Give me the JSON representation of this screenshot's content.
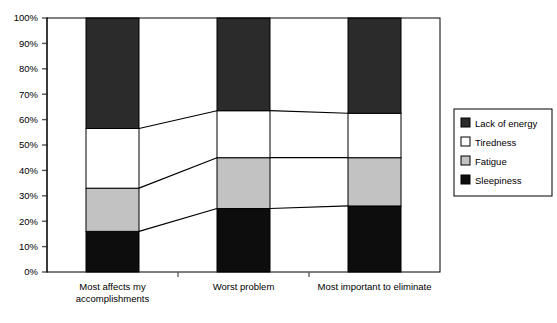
{
  "chart_data": {
    "type": "bar",
    "subtype": "stacked-100-percent",
    "title": "",
    "xlabel": "",
    "ylabel": "",
    "ylim": [
      0,
      100
    ],
    "ytick_labels": [
      "0%",
      "10%",
      "20%",
      "30%",
      "40%",
      "50%",
      "60%",
      "70%",
      "80%",
      "90%",
      "100%"
    ],
    "ytick_values": [
      0,
      10,
      20,
      30,
      40,
      50,
      60,
      70,
      80,
      90,
      100
    ],
    "grid": false,
    "legend_position": "right",
    "categories": [
      "Most affects my accomplishments",
      "Worst problem",
      "Most important to eliminate"
    ],
    "category_lines": [
      [
        "Most affects my",
        "accomplishments"
      ],
      [
        "Worst problem"
      ],
      [
        "Most important to eliminate"
      ]
    ],
    "series": [
      {
        "name": "Sleepiness",
        "color": "#0d0d0d",
        "values": [
          16,
          25,
          26
        ]
      },
      {
        "name": "Fatigue",
        "color": "#c2c2c2",
        "values": [
          17,
          20,
          19
        ]
      },
      {
        "name": "Tiredness",
        "color": "#ffffff",
        "values": [
          23.5,
          18.5,
          17.5
        ]
      },
      {
        "name": "Lack of energy",
        "color": "#2b2b2b",
        "values": [
          43.5,
          36.5,
          37.5
        ]
      }
    ],
    "cumulative_tops": [
      {
        "series": "Sleepiness",
        "values": [
          16,
          25,
          26
        ]
      },
      {
        "series": "Fatigue",
        "values": [
          33,
          45,
          45
        ]
      },
      {
        "series": "Tiredness",
        "values": [
          56.5,
          63.5,
          62.5
        ]
      },
      {
        "series": "Lack of energy",
        "values": [
          100,
          100,
          100
        ]
      }
    ],
    "connector_lines": true
  },
  "legend": {
    "items": [
      {
        "label": "Lack of energy",
        "swatch": "#2b2b2b",
        "swatch_name": "legend-swatch-lack-of-energy"
      },
      {
        "label": "Tiredness",
        "swatch": "#ffffff",
        "swatch_name": "legend-swatch-tiredness"
      },
      {
        "label": "Fatigue",
        "swatch": "#c2c2c2",
        "swatch_name": "legend-swatch-fatigue"
      },
      {
        "label": "Sleepiness",
        "swatch": "#0d0d0d",
        "swatch_name": "legend-swatch-sleepiness"
      }
    ]
  },
  "axis": {
    "y_ticks": [
      "100%",
      "90%",
      "80%",
      "70%",
      "60%",
      "50%",
      "40%",
      "30%",
      "20%",
      "10%",
      "0%"
    ]
  },
  "colors": {
    "axis": "#555555",
    "plot_border": "#000000",
    "connector": "#000000",
    "background": "#ffffff"
  }
}
